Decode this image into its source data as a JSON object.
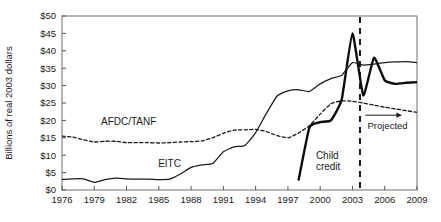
{
  "chart_data": {
    "type": "line",
    "title": "",
    "subtitle": "",
    "xlabel": "",
    "ylabel": "Billions of real 2003 dollars",
    "xlim": [
      1976,
      2009
    ],
    "ylim": [
      0,
      50
    ],
    "grid": false,
    "legend_position": "inline-labels",
    "y_tick_labels": [
      "$0",
      "$5",
      "$10",
      "$15",
      "$20",
      "$25",
      "$30",
      "$35",
      "$40",
      "$45",
      "$50"
    ],
    "y_tick_values": [
      0,
      5,
      10,
      15,
      20,
      25,
      30,
      35,
      40,
      45,
      50
    ],
    "x_tick_labels": [
      "1976",
      "1979",
      "1982",
      "1985",
      "1988",
      "1991",
      "1994",
      "1997",
      "2000",
      "2003",
      "2006",
      "2009"
    ],
    "x_tick_values": [
      1976,
      1979,
      1982,
      1985,
      1988,
      1991,
      1994,
      1997,
      2000,
      2003,
      2006,
      2009
    ],
    "series": [
      {
        "name": "EITC",
        "style": "solid",
        "color": "#1a1a1a",
        "label_text": "EITC",
        "label_x": 1986.0,
        "label_y": 6.6,
        "x": [
          1976,
          1977,
          1978,
          1979,
          1980,
          1981,
          1982,
          1983,
          1984,
          1985,
          1986,
          1987,
          1988,
          1989,
          1990,
          1991,
          1992,
          1993,
          1994,
          1995,
          1996,
          1997,
          1998,
          1999,
          2000,
          2001,
          2002,
          2003,
          2004,
          2005,
          2006,
          2007,
          2008,
          2009
        ],
        "values": [
          3.0,
          3.2,
          3.2,
          2.2,
          3.0,
          3.4,
          3.2,
          3.1,
          3.1,
          3.0,
          3.1,
          4.6,
          6.5,
          7.2,
          7.6,
          11.0,
          12.4,
          12.8,
          16.5,
          22.0,
          27.0,
          28.5,
          28.8,
          28.3,
          30.5,
          32.0,
          33.0,
          36.6,
          35.9,
          36.2,
          36.6,
          36.8,
          36.9,
          36.6
        ]
      },
      {
        "name": "AFDC/TANF",
        "style": "dashed",
        "color": "#1a1a1a",
        "label_text": "AFDC/TANF",
        "label_x": 1982.2,
        "label_y": 18.6,
        "x": [
          1976,
          1977,
          1978,
          1979,
          1980,
          1981,
          1982,
          1983,
          1984,
          1985,
          1986,
          1987,
          1988,
          1989,
          1990,
          1991,
          1992,
          1993,
          1994,
          1995,
          1996,
          1997,
          1998,
          1999,
          2000,
          2001,
          2002,
          2003,
          2004,
          2005,
          2006,
          2007,
          2008,
          2009
        ],
        "values": [
          15.5,
          15.2,
          14.4,
          13.8,
          14.0,
          14.0,
          13.6,
          13.6,
          13.6,
          13.5,
          13.6,
          13.8,
          13.9,
          14.1,
          15.0,
          16.3,
          17.2,
          17.3,
          17.4,
          16.8,
          15.6,
          15.0,
          16.4,
          18.5,
          21.8,
          24.8,
          25.6,
          25.5,
          25.0,
          24.4,
          23.8,
          23.3,
          22.8,
          22.3
        ]
      },
      {
        "name": "Child credit",
        "style": "solid-thick",
        "color": "#0d0d0d",
        "label_text": "Child credit",
        "label_lines": [
          "Child",
          "credit"
        ],
        "label_x": 1999.6,
        "label_y": 9.0,
        "x": [
          1998,
          1999,
          2000,
          2001,
          2002,
          2003,
          2004,
          2005,
          2006,
          2007,
          2008,
          2009
        ],
        "values": [
          3.0,
          18.0,
          19.5,
          20.0,
          26.0,
          45.0,
          27.2,
          38.0,
          31.5,
          30.5,
          30.8,
          31.0
        ]
      }
    ],
    "annotations": [
      {
        "name": "projected-divider",
        "type": "vline",
        "x": 2003.7,
        "style": "dashed"
      },
      {
        "name": "projected-arrow",
        "type": "arrow",
        "text": "Projected",
        "x_start": 2004.2,
        "x_end": 2007.6,
        "y": 21.5
      },
      {
        "name": "projected-label",
        "type": "text",
        "text": "Projected",
        "x": 2004.4,
        "y": 17.5
      }
    ]
  }
}
